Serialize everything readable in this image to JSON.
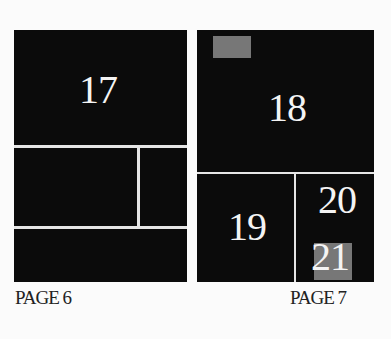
{
  "pages": [
    {
      "label": "PAGE 6",
      "panels": [
        {
          "id": "panel-17",
          "number": "17"
        },
        {
          "id": "panel-left-middle-large",
          "number": ""
        },
        {
          "id": "panel-left-middle-small",
          "number": ""
        },
        {
          "id": "panel-left-bottom",
          "number": ""
        }
      ]
    },
    {
      "label": "PAGE 7",
      "panels": [
        {
          "id": "panel-18",
          "number": "18"
        },
        {
          "id": "panel-19",
          "number": "19"
        },
        {
          "id": "panel-20-21",
          "numbers": [
            "20",
            "21"
          ]
        }
      ]
    }
  ],
  "colors": {
    "panel": "#0b0b0b",
    "gutter": "#e6e6e6",
    "highlight": "#777777",
    "background": "#fbfbfb"
  }
}
